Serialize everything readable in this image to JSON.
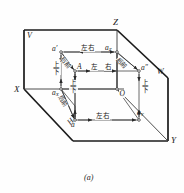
{
  "figure": {
    "caption": "(a)",
    "type": "descriptive-geometry-three-projection-planes"
  },
  "planes": {
    "v": "V",
    "h": "H",
    "w": "W"
  },
  "axes": {
    "x": "X",
    "y": "Y",
    "z": "Z",
    "origin": "O"
  },
  "points": {
    "a_space": "A",
    "a_horizontal": "a",
    "a_vertical": "a′",
    "a_profile": "a″",
    "a_x_main": "a",
    "a_x_sub": "X",
    "a_y_main": "a",
    "a_y_sub": "Y",
    "a_z_main": "a",
    "a_z_sub": "Z"
  },
  "direction_labels": {
    "left_right": "左右",
    "left": "左",
    "right": "右",
    "up_down_up": "上",
    "up_down_down": "下",
    "back_front": "后前"
  },
  "colors": {
    "outline": "#1b1b1b",
    "thin_line": "#4a4a4a",
    "background": "#fefefe",
    "text": "#1a1a1a"
  },
  "measure_arrows": [
    {
      "name": "left-right-top",
      "label": "左右"
    },
    {
      "name": "left-right-middle",
      "label": "左右"
    },
    {
      "name": "left-right-bottom",
      "label": "左右"
    },
    {
      "name": "up-down-left",
      "label": "上下"
    },
    {
      "name": "up-down-center",
      "label": "上下"
    },
    {
      "name": "up-down-right",
      "label": "上下"
    },
    {
      "name": "back-front-upper",
      "label": "后前"
    },
    {
      "name": "back-front-lower",
      "label": "后前"
    },
    {
      "name": "back-front-right",
      "label": "后前"
    }
  ]
}
